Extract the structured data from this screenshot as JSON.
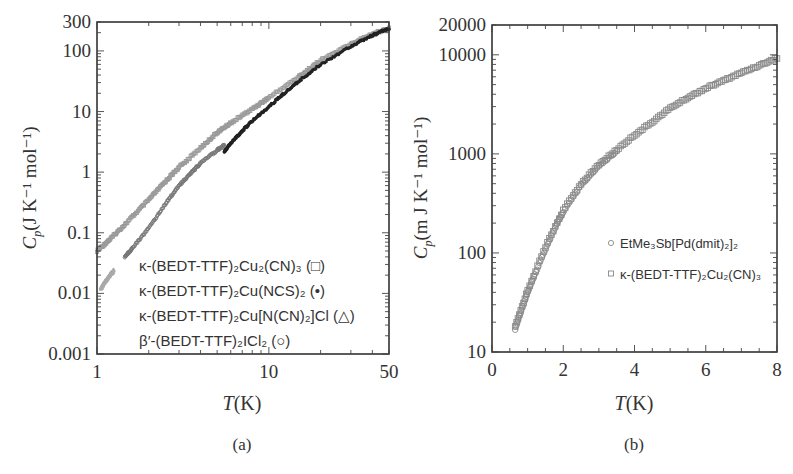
{
  "chart_data": [
    {
      "panel": "a",
      "type": "scatter",
      "caption": "(a)",
      "xlabel": "T(K)",
      "ylabel": "Cp(J K^-1 mol^-1)",
      "xscale": "log",
      "yscale": "log",
      "xlim": [
        1,
        50
      ],
      "ylim": [
        0.001,
        300
      ],
      "xticks": [
        1,
        10,
        50
      ],
      "xtick_labels": [
        "1",
        "10",
        "50"
      ],
      "yticks": [
        0.001,
        0.01,
        0.1,
        1,
        10,
        100,
        300
      ],
      "ytick_labels": [
        "0.001",
        "0.01",
        "0.1",
        "1",
        "10",
        "100",
        "300"
      ],
      "grid": false,
      "legend_position": "lower right (inside)",
      "series": [
        {
          "name": "κ-(BEDT-TTF)2Cu2(CN)3",
          "marker": "□",
          "color": "#9a9a9a",
          "x": [
            1.0,
            1.2,
            1.5,
            2.0,
            2.5,
            3.0,
            4.0,
            5.0,
            6.0,
            8.0,
            10,
            15,
            20,
            30,
            40,
            50
          ],
          "y": [
            0.05,
            0.08,
            0.15,
            0.35,
            0.7,
            1.2,
            2.5,
            4.5,
            6.5,
            11,
            17,
            38,
            70,
            130,
            190,
            240
          ]
        },
        {
          "name": "κ-(BEDT-TTF)2Cu(NCS)2",
          "marker": "•",
          "color": "#222222",
          "x": [
            5.5,
            6.0,
            7.0,
            8.0,
            10,
            12,
            15,
            20,
            30,
            40,
            50
          ],
          "y": [
            2.2,
            3.0,
            4.8,
            7.0,
            12,
            19,
            32,
            60,
            120,
            180,
            235
          ]
        },
        {
          "name": "κ-(BEDT-TTF)2Cu[N(CN)2]Cl",
          "marker": "△",
          "color": "#aaaaaa",
          "x": [
            1.05,
            1.1,
            1.15,
            1.2,
            1.25
          ],
          "y": [
            0.012,
            0.015,
            0.018,
            0.021,
            0.024
          ]
        },
        {
          "name": "β'-(BEDT-TTF)2ICl2",
          "marker": "○",
          "color": "#777777",
          "x": [
            1.45,
            1.6,
            2.0,
            2.5,
            3.0,
            3.5,
            4.0,
            5.0,
            5.5
          ],
          "y": [
            0.04,
            0.055,
            0.12,
            0.3,
            0.6,
            0.95,
            1.4,
            2.3,
            2.8
          ]
        }
      ]
    },
    {
      "panel": "b",
      "type": "scatter",
      "caption": "(b)",
      "xlabel": "T(K)",
      "ylabel": "Cp(m J K^-1 mol^-1)",
      "xscale": "linear",
      "yscale": "log",
      "xlim": [
        0,
        8
      ],
      "ylim": [
        10,
        20000
      ],
      "xticks": [
        0,
        2,
        4,
        6,
        8
      ],
      "xtick_labels": [
        "0",
        "2",
        "4",
        "6",
        "8"
      ],
      "yticks": [
        10,
        100,
        1000,
        10000,
        20000
      ],
      "ytick_labels": [
        "10",
        "100",
        "1000",
        "10000",
        "20000"
      ],
      "grid": false,
      "legend_position": "center right (inside)",
      "series": [
        {
          "name": "EtMe3Sb[Pd(dmit)2]2",
          "marker": "○",
          "color": "#8a8a8a",
          "x": [
            0.65,
            0.8,
            1.0,
            1.2,
            1.5,
            1.8,
            2.0,
            2.5,
            3.0,
            3.5
          ],
          "y": [
            17,
            25,
            40,
            60,
            110,
            190,
            260,
            480,
            750,
            1050
          ]
        },
        {
          "name": "κ-(BEDT-TTF)2Cu2(CN)3",
          "marker": "□",
          "color": "#8a8a8a",
          "x": [
            0.65,
            1.0,
            1.5,
            2.0,
            2.5,
            3.0,
            3.5,
            4.0,
            4.5,
            5.0,
            5.5,
            6.0,
            6.5,
            7.0,
            7.5,
            8.0
          ],
          "y": [
            18,
            42,
            115,
            270,
            500,
            780,
            1100,
            1550,
            2100,
            2900,
            3700,
            4600,
            5500,
            6600,
            7800,
            9300
          ]
        }
      ]
    }
  ],
  "labels": {
    "a": {
      "caption": "(a)",
      "xlabel_var": "T",
      "xlabel_unit": "(K)",
      "ylabel_var": "C",
      "ylabel_sub": "p",
      "ylabel_unit": "(J K⁻¹ mol⁻¹)",
      "legend": [
        "κ-(BEDT-TTF)₂Cu₂(CN)₃ (□)",
        "κ-(BEDT-TTF)₂Cu(NCS)₂ (•)",
        "κ-(BEDT-TTF)₂Cu[N(CN)₂]Cl (△)",
        "β′-(BEDT-TTF)₂ICl₂ (○)"
      ]
    },
    "b": {
      "caption": "(b)",
      "xlabel_var": "T",
      "xlabel_unit": "(K)",
      "ylabel_var": "C",
      "ylabel_sub": "p",
      "ylabel_unit": "(m J K⁻¹ mol⁻¹)",
      "legend": [
        "EtMe₃Sb[Pd(dmit)₂]₂",
        "κ-(BEDT-TTF)₂Cu₂(CN)₃"
      ]
    }
  }
}
